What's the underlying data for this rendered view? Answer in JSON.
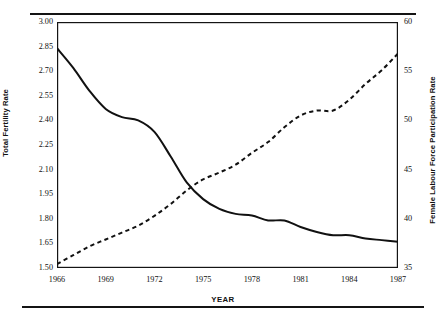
{
  "chart_data": {
    "type": "line",
    "title": "",
    "xlabel": "YEAR",
    "ylabel": "Total Fertility Rate",
    "ylabel_right": "Female Labour Force Participation Rate",
    "grid": false,
    "legend": "none",
    "xlim": [
      1966,
      1987
    ],
    "ylim": [
      1.5,
      3.0
    ],
    "ylim_right": [
      35,
      60
    ],
    "xticks": [
      1966,
      1969,
      1972,
      1975,
      1978,
      1981,
      1984,
      1987
    ],
    "xtick_labels": [
      "1966",
      "1969",
      "1972",
      "1975",
      "1978",
      "1981",
      "1984",
      "1987"
    ],
    "yticks": [
      1.5,
      1.65,
      1.8,
      1.95,
      2.1,
      2.25,
      2.4,
      2.55,
      2.7,
      2.85,
      3.0
    ],
    "ytick_labels": [
      "1.50",
      "1.65",
      "1.80",
      "1.95",
      "2.10",
      "2.25",
      "2.40",
      "2.55",
      "2.70",
      "2.85",
      "3.00"
    ],
    "yticks_right": [
      35,
      40,
      45,
      50,
      55,
      60
    ],
    "ytick_labels_right": [
      "35",
      "40",
      "45",
      "50",
      "55",
      "60"
    ],
    "x": [
      1966,
      1967,
      1968,
      1969,
      1970,
      1971,
      1972,
      1973,
      1974,
      1975,
      1976,
      1977,
      1978,
      1979,
      1980,
      1981,
      1982,
      1983,
      1984,
      1985,
      1986,
      1987
    ],
    "series": [
      {
        "name": "Total Fertility Rate",
        "axis": "left",
        "style": "solid",
        "color": "#111111",
        "values": [
          2.84,
          2.72,
          2.58,
          2.47,
          2.42,
          2.4,
          2.33,
          2.18,
          2.02,
          1.92,
          1.86,
          1.83,
          1.82,
          1.79,
          1.79,
          1.75,
          1.72,
          1.7,
          1.7,
          1.68,
          1.67,
          1.66
        ]
      },
      {
        "name": "Female Labour Force Participation Rate",
        "axis": "right",
        "style": "dashed",
        "color": "#111111",
        "values": [
          35.4,
          36.3,
          37.2,
          37.9,
          38.6,
          39.3,
          40.3,
          41.5,
          42.9,
          44.0,
          44.7,
          45.5,
          46.7,
          47.8,
          49.3,
          50.5,
          51.0,
          51.0,
          52.1,
          53.7,
          55.1,
          56.8
        ]
      }
    ]
  },
  "axes": {
    "xlabel": "YEAR",
    "ylabel_left": "Total Fertility Rate",
    "ylabel_right": "Female Labour Force Participation Rate"
  }
}
